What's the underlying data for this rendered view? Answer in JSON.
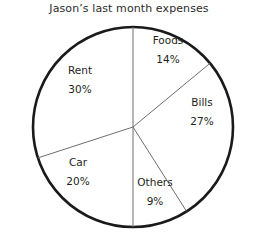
{
  "chart_data": {
    "type": "pie",
    "title": "Jason’s last month expenses",
    "xlabel": "",
    "ylabel": "",
    "legend": "none",
    "grid": false,
    "start_angle_deg": 0,
    "direction": "clockwise",
    "unit": "%",
    "categories": [
      "Foods",
      "Bills",
      "Others",
      "Car",
      "Rent"
    ],
    "values": [
      14,
      27,
      9,
      20,
      30
    ],
    "total": 100,
    "slices": [
      {
        "label": "Foods",
        "value": 14,
        "value_text": "14%"
      },
      {
        "label": "Bills",
        "value": 27,
        "value_text": "27%"
      },
      {
        "label": "Others",
        "value": 9,
        "value_text": "9%"
      },
      {
        "label": "Car",
        "value": 20,
        "value_text": "20%"
      },
      {
        "label": "Rent",
        "value": 30,
        "value_text": "30%"
      }
    ],
    "colors": {
      "slice_fill": "#ffffff",
      "outline": "#1a1a1a",
      "divider": "#6e6e6e",
      "text": "#231f20",
      "background": "#ffffff"
    }
  }
}
